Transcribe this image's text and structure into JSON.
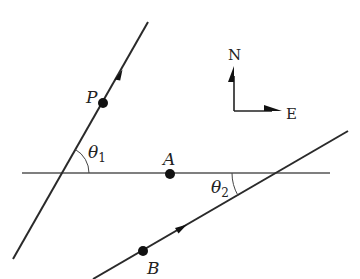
{
  "diagram": {
    "colors": {
      "line": "#2a2a2a",
      "horizontal": "#555555",
      "point": "#111111",
      "background": "#ffffff"
    },
    "points": [
      {
        "id": "P",
        "label": "P",
        "x": 103,
        "y": 103
      },
      {
        "id": "A",
        "label": "A",
        "x": 170,
        "y": 174
      },
      {
        "id": "B",
        "label": "B",
        "x": 143,
        "y": 251
      }
    ],
    "lines": [
      {
        "id": "path-P",
        "x1": 13,
        "y1": 259,
        "x2": 148,
        "y2": 22,
        "arrow_at": [
          120,
          74
        ]
      },
      {
        "id": "reference-line-A",
        "x1": 22,
        "y1": 173,
        "x2": 330,
        "y2": 173
      },
      {
        "id": "path-B",
        "x1": 93,
        "y1": 279,
        "x2": 348,
        "y2": 131,
        "arrow_at": [
          181,
          228
        ]
      }
    ],
    "angles": [
      {
        "id": "theta1",
        "label": "θ",
        "subscript": "1"
      },
      {
        "id": "theta2",
        "label": "θ",
        "subscript": "2"
      }
    ],
    "compass": {
      "north_label": "N",
      "east_label": "E"
    }
  }
}
